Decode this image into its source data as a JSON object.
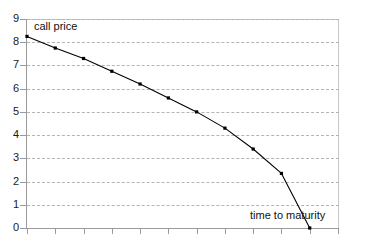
{
  "chart_data": {
    "type": "line",
    "title": "",
    "subtitle": "",
    "xlabel": "time to maturity",
    "ylabel": "call price",
    "ylim": [
      0,
      9
    ],
    "xlim": [
      0,
      11
    ],
    "grid": true,
    "legend": false,
    "legend_position": "none",
    "y_ticks": [
      "0",
      "1",
      "2",
      "3",
      "4",
      "5",
      "6",
      "7",
      "8",
      "9"
    ],
    "x_ticks": [
      "",
      "",
      "",
      "",
      "",
      "",
      "",
      "",
      "",
      "",
      "",
      ""
    ],
    "x_tick_count": 12,
    "x": [
      0,
      1,
      2,
      3,
      4,
      5,
      6,
      7,
      8,
      9,
      10
    ],
    "values": [
      8.25,
      7.75,
      7.3,
      6.75,
      6.2,
      5.6,
      5.0,
      4.3,
      3.4,
      2.35,
      0.0
    ],
    "series": [
      {
        "name": "call price",
        "values": [
          8.25,
          7.75,
          7.3,
          6.75,
          6.2,
          5.6,
          5.0,
          4.3,
          3.4,
          2.35,
          0.0
        ],
        "color": "#000000",
        "marker": "square"
      }
    ],
    "annotations": [
      {
        "text": "call price",
        "position": "top-left"
      },
      {
        "text": "time to maturity",
        "position": "bottom-right"
      }
    ],
    "colors": {
      "line": "#000000",
      "marker": "#000000",
      "grid": "#b4b4b4",
      "axis": "#9a9a9a",
      "frame": "#c8c8c8",
      "background": "#ffffff",
      "text": "#111111"
    }
  }
}
